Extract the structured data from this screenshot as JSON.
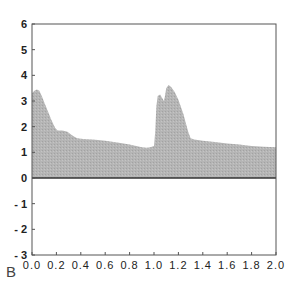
{
  "panel_label": "B",
  "chart_data": {
    "type": "area",
    "title": "",
    "xlabel": "",
    "ylabel": "",
    "xlim": [
      0.0,
      2.0
    ],
    "ylim": [
      -3,
      6
    ],
    "grid": false,
    "legend": null,
    "x_ticks": [
      "0.0",
      "0.2",
      "0.4",
      "0.6",
      "0.8",
      "1.0",
      "1.2",
      "1.4",
      "1.6",
      "1.8",
      "2.0"
    ],
    "y_ticks": [
      "6",
      "5",
      "4",
      "3",
      "2",
      "1",
      "0",
      "- 1",
      "- 2",
      "- 3"
    ],
    "fill_color": "#b3b3b3",
    "baseline": 0,
    "series": [
      {
        "name": "signal",
        "x": [
          0.0,
          0.02,
          0.04,
          0.06,
          0.08,
          0.1,
          0.13,
          0.16,
          0.19,
          0.21,
          0.25,
          0.29,
          0.33,
          0.37,
          0.42,
          0.5,
          0.6,
          0.7,
          0.8,
          0.9,
          0.94,
          0.97,
          1.0,
          1.01,
          1.02,
          1.03,
          1.05,
          1.07,
          1.08,
          1.09,
          1.1,
          1.12,
          1.14,
          1.17,
          1.2,
          1.24,
          1.28,
          1.3,
          1.33,
          1.4,
          1.5,
          1.6,
          1.7,
          1.8,
          1.9,
          2.0
        ],
        "y": [
          3.3,
          3.4,
          3.45,
          3.4,
          3.2,
          2.95,
          2.6,
          2.25,
          1.95,
          1.85,
          1.85,
          1.8,
          1.65,
          1.55,
          1.52,
          1.5,
          1.45,
          1.38,
          1.3,
          1.2,
          1.18,
          1.2,
          1.25,
          1.8,
          2.8,
          3.2,
          3.25,
          3.1,
          3.0,
          3.2,
          3.5,
          3.62,
          3.55,
          3.35,
          3.05,
          2.5,
          1.8,
          1.55,
          1.5,
          1.45,
          1.4,
          1.35,
          1.3,
          1.25,
          1.22,
          1.2
        ]
      }
    ]
  }
}
